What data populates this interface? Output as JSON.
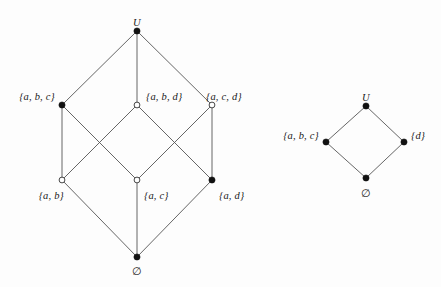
{
  "figure": {
    "type": "hasse-diagram",
    "background_color": "#fdfdfd",
    "edge_color": "#555555",
    "node_fill_solid": "#111111",
    "node_fill_open": "#ffffff",
    "node_stroke": "#333333"
  },
  "diagrams": [
    {
      "id": "left-lattice",
      "nodes": [
        {
          "id": "U",
          "label": "U",
          "x": 137,
          "y": 31,
          "fill": "solid",
          "label_x": 137,
          "label_y": 18,
          "anchor": "center"
        },
        {
          "id": "abc",
          "label": "{a, b, c}",
          "x": 62,
          "y": 105,
          "fill": "solid",
          "label_x": 55,
          "label_y": 92,
          "anchor": "right"
        },
        {
          "id": "abd",
          "label": "{a, b, d}",
          "x": 137,
          "y": 105,
          "fill": "open",
          "label_x": 146,
          "label_y": 92,
          "anchor": "left"
        },
        {
          "id": "acd",
          "label": "{a, c, d}",
          "x": 212,
          "y": 105,
          "fill": "open",
          "label_x": 206,
          "label_y": 92,
          "anchor": "left"
        },
        {
          "id": "ab",
          "label": "{a, b}",
          "x": 62,
          "y": 180,
          "fill": "open",
          "label_x": 64,
          "label_y": 191,
          "anchor": "right"
        },
        {
          "id": "ac",
          "label": "{a, c}",
          "x": 137,
          "y": 180,
          "fill": "open",
          "label_x": 144,
          "label_y": 191,
          "anchor": "left"
        },
        {
          "id": "ad",
          "label": "{a, d}",
          "x": 212,
          "y": 180,
          "fill": "solid",
          "label_x": 219,
          "label_y": 191,
          "anchor": "left"
        },
        {
          "id": "empty",
          "label": "∅",
          "x": 137,
          "y": 257,
          "fill": "solid",
          "label_x": 137,
          "label_y": 266,
          "anchor": "center"
        }
      ],
      "edges": [
        {
          "from": "U",
          "to": "abc"
        },
        {
          "from": "U",
          "to": "abd"
        },
        {
          "from": "U",
          "to": "acd"
        },
        {
          "from": "abc",
          "to": "ab"
        },
        {
          "from": "abc",
          "to": "ac"
        },
        {
          "from": "abd",
          "to": "ab"
        },
        {
          "from": "abd",
          "to": "ad"
        },
        {
          "from": "acd",
          "to": "ac"
        },
        {
          "from": "acd",
          "to": "ad"
        },
        {
          "from": "ab",
          "to": "empty"
        },
        {
          "from": "ac",
          "to": "empty"
        },
        {
          "from": "ad",
          "to": "empty"
        }
      ]
    },
    {
      "id": "right-lattice",
      "nodes": [
        {
          "id": "rU",
          "label": "U",
          "x": 366,
          "y": 106,
          "fill": "solid",
          "label_x": 366,
          "label_y": 93,
          "anchor": "center"
        },
        {
          "id": "rabc",
          "label": "{a, b, c}",
          "x": 326,
          "y": 142,
          "fill": "solid",
          "label_x": 319,
          "label_y": 131,
          "anchor": "right"
        },
        {
          "id": "rd",
          "label": "{d}",
          "x": 404,
          "y": 142,
          "fill": "solid",
          "label_x": 411,
          "label_y": 131,
          "anchor": "left"
        },
        {
          "id": "rempty",
          "label": "∅",
          "x": 366,
          "y": 178,
          "fill": "solid",
          "label_x": 366,
          "label_y": 188,
          "anchor": "center"
        }
      ],
      "edges": [
        {
          "from": "rU",
          "to": "rabc"
        },
        {
          "from": "rU",
          "to": "rd"
        },
        {
          "from": "rabc",
          "to": "rempty"
        },
        {
          "from": "rd",
          "to": "rempty"
        }
      ]
    }
  ]
}
